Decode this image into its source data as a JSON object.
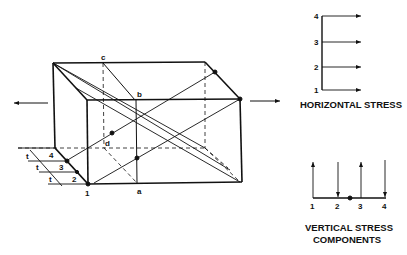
{
  "figure": {
    "type": "stress-block-diagram",
    "colors": {
      "ink": "#111111",
      "background": "#ffffff"
    },
    "block": {
      "vertex_labels": {
        "a": "a",
        "b": "b",
        "c": "c",
        "d": "d"
      },
      "corner_label": "1",
      "layer_labels": [
        "4",
        "3",
        "2"
      ],
      "thickness_labels": [
        "t",
        "t",
        "t"
      ],
      "arrows": [
        "left-arrow",
        "right-arrow"
      ]
    },
    "horizontal_stress": {
      "levels": [
        "4",
        "3",
        "2",
        "1"
      ],
      "caption": "HORIZONTAL STRESS"
    },
    "vertical_stress": {
      "positions": [
        "1",
        "2",
        "3",
        "4"
      ],
      "directions": [
        "up",
        "down",
        "up",
        "down"
      ],
      "caption_line1": "VERTICAL STRESS",
      "caption_line2": "COMPONENTS"
    }
  }
}
